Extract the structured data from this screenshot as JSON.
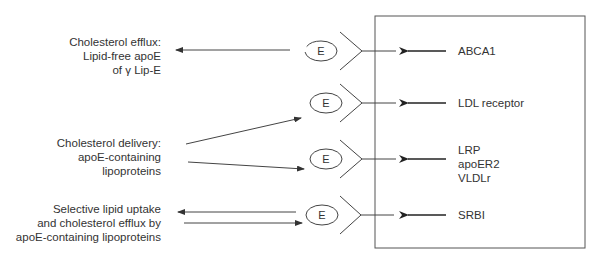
{
  "diagram": {
    "colors": {
      "line": "#444444",
      "text": "#333333",
      "background": "#ffffff"
    },
    "ligand_symbol": "E",
    "left_labels": [
      {
        "id": "efflux",
        "lines": [
          "Cholesterol efflux:",
          "Lipid-free apoE",
          "of γ Lip-E"
        ]
      },
      {
        "id": "delivery",
        "lines": [
          "Cholesterol delivery:",
          "apoE-containing",
          "lipoproteins"
        ]
      },
      {
        "id": "selective",
        "lines": [
          "Selective lipid uptake",
          "and cholesterol efflux by",
          "apoE-containing lipoproteins"
        ]
      }
    ],
    "receptors": [
      {
        "id": "abca1",
        "lines": [
          "ABCA1"
        ]
      },
      {
        "id": "ldl",
        "lines": [
          "LDL receptor"
        ]
      },
      {
        "id": "lrp",
        "lines": [
          "LRP",
          "apoER2",
          "VLDLr"
        ]
      },
      {
        "id": "srbi",
        "lines": [
          "SRBI"
        ]
      }
    ]
  }
}
